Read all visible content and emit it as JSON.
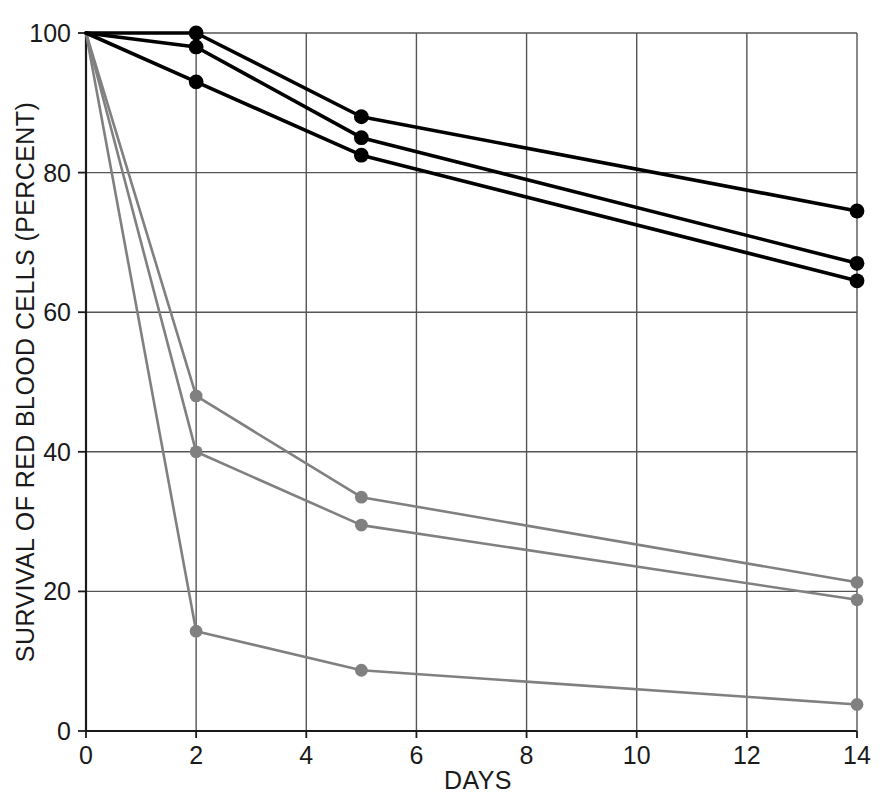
{
  "chart_data": {
    "type": "line",
    "title": "",
    "xlabel": "DAYS",
    "ylabel": "SURVIVAL OF RED BLOOD CELLS (PERCENT)",
    "xlim": [
      0,
      14
    ],
    "ylim": [
      0,
      100
    ],
    "xticks": [
      0,
      2,
      4,
      6,
      8,
      10,
      12,
      14
    ],
    "yticks": [
      0,
      20,
      40,
      60,
      80,
      100
    ],
    "xtick_labels": [
      "0",
      "2",
      "4",
      "6",
      "8",
      "10",
      "12",
      "14"
    ],
    "ytick_labels": [
      "0",
      "20",
      "40",
      "60",
      "80",
      "100"
    ],
    "grid": true,
    "grid_style": "solid-thin",
    "legend": "none",
    "x": [
      0,
      2,
      5,
      14
    ],
    "series": [
      {
        "name": "black-series-1",
        "color": "#000000",
        "marker": "filled-circle",
        "values": [
          100,
          100,
          88,
          74.5
        ]
      },
      {
        "name": "black-series-2",
        "color": "#000000",
        "marker": "filled-circle",
        "values": [
          100,
          98,
          85,
          67
        ]
      },
      {
        "name": "black-series-3",
        "color": "#000000",
        "marker": "filled-circle",
        "values": [
          100,
          93,
          82.5,
          64.5
        ]
      },
      {
        "name": "gray-series-1",
        "color": "#808080",
        "marker": "filled-circle",
        "values": [
          100,
          48,
          33.5,
          21.3
        ]
      },
      {
        "name": "gray-series-2",
        "color": "#808080",
        "marker": "filled-circle",
        "values": [
          100,
          40,
          29.5,
          18.8
        ]
      },
      {
        "name": "gray-series-3",
        "color": "#808080",
        "marker": "filled-circle",
        "values": [
          100,
          14.3,
          8.7,
          3.8
        ]
      }
    ]
  },
  "colors": {
    "axis": "#1a1a1a",
    "grid": "#555555",
    "black_series": "#000000",
    "gray_series": "#808080",
    "background": "#ffffff"
  },
  "axes": {
    "x_title": "DAYS",
    "y_title": "SURVIVAL OF RED BLOOD CELLS (PERCENT)"
  }
}
